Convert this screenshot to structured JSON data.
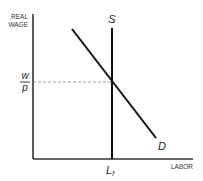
{
  "diagram": {
    "type": "labor-market-supply-demand",
    "y_axis_label_line1": "REAL",
    "y_axis_label_line2": "WAGE",
    "x_axis_label": "LABOR",
    "supply_label": "S",
    "demand_label": "D",
    "equilibrium_wage_numerator": "w",
    "equilibrium_wage_denominator": "p",
    "equilibrium_labor_main": "L",
    "equilibrium_labor_subscript": "f",
    "colors": {
      "axis": "#333333",
      "curve": "#111111",
      "dashed": "#888888",
      "background": "#ffffff"
    }
  }
}
